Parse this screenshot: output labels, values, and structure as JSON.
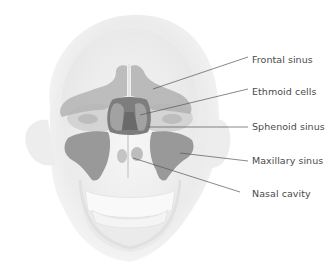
{
  "diagram": {
    "colors": {
      "background": "#ffffff",
      "head": "#ececec",
      "skull": "#f3f3f3",
      "sinus_light": "#a9a9a9",
      "sinus_medium": "#8f8f8f",
      "sinus_dark": "#6f6f6f",
      "leader_line": "#555555",
      "label_text": "#4a4a4a"
    },
    "labels": [
      {
        "id": "frontal",
        "text": "Frontal sinus",
        "x": 252,
        "y": 57
      },
      {
        "id": "ethmoid",
        "text": "Ethmoid cells",
        "x": 252,
        "y": 89
      },
      {
        "id": "sphenoid",
        "text": "Sphenoid sinus",
        "x": 252,
        "y": 122
      },
      {
        "id": "maxillary",
        "text": "Maxillary sinus",
        "x": 252,
        "y": 155
      },
      {
        "id": "nasal",
        "text": "Nasal cavity",
        "x": 252,
        "y": 188
      }
    ]
  }
}
